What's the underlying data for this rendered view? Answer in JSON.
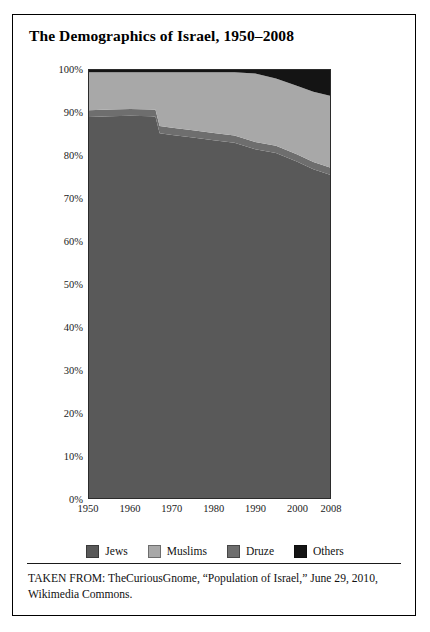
{
  "figure": {
    "title": "The Demographics of Israel, 1950–2008",
    "caption": "TAKEN FROM: TheCuriousGnome, “Population of Israel,” June 29, 2010, Wikimedia Commons."
  },
  "legend": {
    "position": "bottom-center",
    "items": [
      {
        "label": "Jews",
        "color": "#595959"
      },
      {
        "label": "Muslims",
        "color": "#a8a8a8"
      },
      {
        "label": "Druze",
        "color": "#6e6e6e"
      },
      {
        "label": "Others",
        "color": "#141414"
      }
    ]
  },
  "axes": {
    "y_ticks": [
      "100%",
      "90%",
      "80%",
      "70%",
      "60%",
      "50%",
      "40%",
      "30%",
      "20%",
      "10%",
      "0%"
    ],
    "x_ticks": [
      "1950",
      "1960",
      "1970",
      "1980",
      "1990",
      "2000",
      "2008"
    ]
  },
  "chart_data": {
    "type": "area",
    "stacked": true,
    "stack_total": 100,
    "title": "The Demographics of Israel, 1950–2008",
    "xlabel": "",
    "ylabel": "",
    "xlim": [
      1950,
      2008
    ],
    "ylim": [
      0,
      100
    ],
    "grid": false,
    "legend_position": "bottom-center",
    "x": [
      1950,
      1955,
      1960,
      1965,
      1966,
      1967,
      1970,
      1975,
      1980,
      1985,
      1990,
      1995,
      2000,
      2004,
      2008
    ],
    "series": [
      {
        "name": "Jews",
        "color": "#595959",
        "values": [
          89.0,
          89.2,
          89.3,
          89.2,
          89.1,
          85.2,
          84.8,
          84.2,
          83.6,
          83.0,
          81.5,
          80.6,
          78.6,
          76.8,
          75.5
        ]
      },
      {
        "name": "Druze",
        "color": "#6e6e6e",
        "values": [
          1.6,
          1.6,
          1.6,
          1.6,
          1.6,
          1.7,
          1.7,
          1.7,
          1.7,
          1.7,
          1.7,
          1.7,
          1.7,
          1.7,
          1.7
        ]
      },
      {
        "name": "Muslims",
        "color": "#a8a8a8",
        "values": [
          8.9,
          8.7,
          8.6,
          8.7,
          8.8,
          12.6,
          13.0,
          13.6,
          14.2,
          14.8,
          16.0,
          15.7,
          16.0,
          16.4,
          16.8
        ]
      },
      {
        "name": "Others",
        "color": "#141414",
        "values": [
          0.5,
          0.5,
          0.5,
          0.5,
          0.5,
          0.5,
          0.5,
          0.5,
          0.5,
          0.5,
          0.8,
          2.0,
          3.7,
          5.1,
          6.0
        ]
      }
    ]
  }
}
